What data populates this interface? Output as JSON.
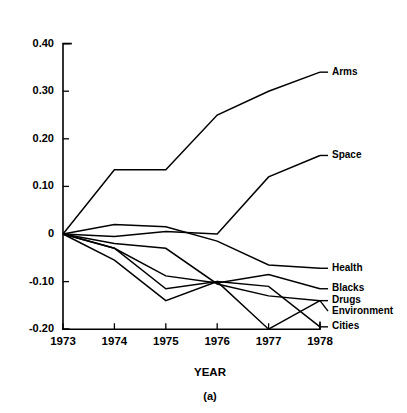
{
  "chart_data": {
    "type": "line",
    "title": "",
    "subtitle": "",
    "xlabel": "YEAR",
    "ylabel": "",
    "caption": "(a)",
    "x": [
      1973,
      1974,
      1975,
      1976,
      1977,
      1978
    ],
    "categories": [
      "1973",
      "1974",
      "1975",
      "1976",
      "1977",
      "1978"
    ],
    "xlim": [
      1973,
      1978
    ],
    "ylim": [
      -0.2,
      0.4
    ],
    "ytick_labels": [
      "0.40",
      "0.30",
      "0.20",
      "0.10",
      "0",
      "-0.10",
      "-0.20"
    ],
    "ytick_values": [
      0.4,
      0.3,
      0.2,
      0.1,
      0,
      -0.1,
      -0.2
    ],
    "xtick_labels": [
      "1973",
      "1974",
      "1975",
      "1976",
      "1977",
      "1978"
    ],
    "grid": false,
    "legend_position": "right-inline-labels",
    "line_color": "#000000",
    "background_color": "#ffffff",
    "series": [
      {
        "name": "Arms",
        "label": "Arms",
        "values": [
          0.0,
          0.135,
          0.135,
          0.25,
          0.3,
          0.34
        ]
      },
      {
        "name": "Space",
        "label": "Space",
        "values": [
          0.0,
          -0.005,
          0.005,
          0.0,
          0.12,
          0.165
        ]
      },
      {
        "name": "Health",
        "label": "Health",
        "values": [
          0.0,
          0.02,
          0.015,
          -0.015,
          -0.065,
          -0.072
        ]
      },
      {
        "name": "Blacks",
        "label": "Blacks",
        "values": [
          0.0,
          -0.03,
          -0.088,
          -0.103,
          -0.085,
          -0.115
        ]
      },
      {
        "name": "Drugs",
        "label": "Drugs",
        "values": [
          0.0,
          -0.02,
          -0.03,
          -0.105,
          -0.13,
          -0.14
        ]
      },
      {
        "name": "Environment",
        "label": "Environment",
        "values": [
          0.0,
          -0.03,
          -0.115,
          -0.1,
          -0.2,
          -0.14
        ]
      },
      {
        "name": "Cities",
        "label": "Cities",
        "values": [
          0.0,
          -0.055,
          -0.14,
          -0.1,
          -0.11,
          -0.195
        ]
      }
    ],
    "label_anchor_y": {
      "Arms": 0.34,
      "Space": 0.165,
      "Health": -0.072,
      "Blacks": -0.115,
      "Drugs": -0.14,
      "Environment": -0.162,
      "Cities": -0.195
    }
  }
}
